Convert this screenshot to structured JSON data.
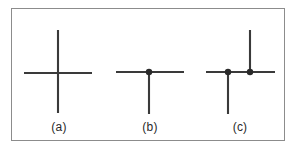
{
  "figure": {
    "type": "line-drawing-diagram",
    "background_color": "#ffffff",
    "stroke_color": "#3a3a3a",
    "frame_color": "#8c8c8c",
    "frame": {
      "x": 11,
      "y": 8,
      "width": 274,
      "height": 133,
      "stroke_width": 1
    },
    "panels": [
      {
        "id": "panel-a",
        "label": "(a)",
        "junction_type": "cross",
        "dots": [],
        "segments": [
          {
            "name": "horizontal",
            "x1": 24,
            "y1": 73,
            "x2": 92,
            "y2": 73
          },
          {
            "name": "vertical",
            "x1": 58,
            "y1": 30,
            "x2": 58,
            "y2": 113
          }
        ]
      },
      {
        "id": "panel-b",
        "label": "(b)",
        "junction_type": "T-junction-down",
        "dots": [
          {
            "name": "junction-dot",
            "cx": 149,
            "cy": 72,
            "r": 3.2
          }
        ],
        "segments": [
          {
            "name": "horizontal",
            "x1": 116,
            "y1": 72,
            "x2": 184,
            "y2": 72
          },
          {
            "name": "vertical-down",
            "x1": 149,
            "y1": 72,
            "x2": 149,
            "y2": 114
          }
        ]
      },
      {
        "id": "panel-c",
        "label": "(c)",
        "junction_type": "double-T-junction",
        "dots": [
          {
            "name": "left-junction-dot",
            "cx": 228,
            "cy": 72,
            "r": 3.2
          },
          {
            "name": "right-junction-dot",
            "cx": 250,
            "cy": 72,
            "r": 3.2
          }
        ],
        "segments": [
          {
            "name": "horizontal",
            "x1": 206,
            "y1": 72,
            "x2": 275,
            "y2": 72
          },
          {
            "name": "left-vertical-down",
            "x1": 228,
            "y1": 72,
            "x2": 228,
            "y2": 114
          },
          {
            "name": "right-vertical-up",
            "x1": 250,
            "y1": 72,
            "x2": 250,
            "y2": 30
          }
        ]
      }
    ],
    "captions": {
      "a": "(a)",
      "b": "(b)",
      "c": "(c)"
    }
  }
}
